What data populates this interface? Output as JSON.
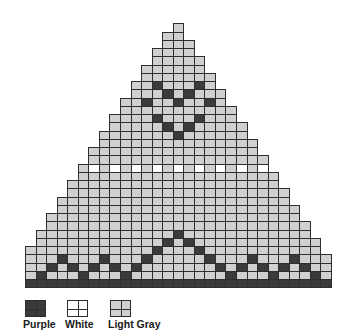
{
  "chart_data": {
    "type": "table",
    "title": "",
    "grid": {
      "rows": 32,
      "cols": 29,
      "apex_col": 14,
      "origin_x": 25,
      "origin_y": 23.3,
      "cell_w": 10.55,
      "cell_h": 8.25,
      "row_bounds_rule": "left = max(0, 14 - floor(r/2)); right = min(28, 14 + floor((r-1)/2)); r = 1-indexed row",
      "default_color": "light_gray",
      "purple_cells": {
        "8": [
          12,
          16
        ],
        "9": [
          13,
          15
        ],
        "10": [
          11,
          14,
          17
        ],
        "12": [
          12,
          16
        ],
        "13": [
          13,
          15
        ],
        "14": [
          14
        ],
        "26": [
          14
        ],
        "27": [
          13,
          15
        ],
        "28": [
          12,
          16
        ],
        "29": [
          3,
          7,
          11,
          17,
          21,
          25
        ],
        "30": [
          2,
          4,
          6,
          8,
          10,
          18,
          20,
          22,
          24,
          26
        ],
        "31": [
          1,
          5,
          9,
          19,
          23,
          27
        ],
        "32": "all"
      },
      "white_cells": {
        "18": [
          6,
          8,
          10,
          12,
          14,
          16,
          18,
          20,
          22
        ]
      }
    }
  },
  "colors": {
    "purple": "#3a3a3a",
    "white": "#ffffff",
    "light_gray": "#d0d0d0",
    "grid_line": "#2e2e2e"
  },
  "legend": {
    "items": [
      {
        "key": "purple",
        "label": "Purple",
        "x": 25
      },
      {
        "key": "white",
        "label": "White",
        "x": 67
      },
      {
        "key": "light_gray",
        "label": "Light Gray",
        "x": 110
      }
    ]
  }
}
